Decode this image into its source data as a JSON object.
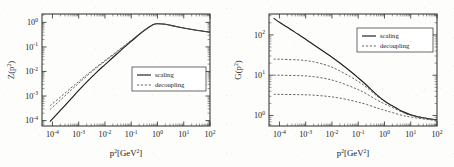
{
  "figure": {
    "background_color": "#fdfdfc",
    "ink_color": "#1c1c1c"
  },
  "chart_data": [
    {
      "type": "line",
      "panel": "left",
      "title": "",
      "xlabel": "p²[GeV²]",
      "ylabel": "Z(p²)",
      "xscale": "log",
      "yscale": "log",
      "xlim": [
        4e-05,
        100
      ],
      "ylim": [
        6e-05,
        2.2
      ],
      "xticks": [
        "10⁻⁴",
        "10⁻³",
        "10⁻²",
        "10⁻¹",
        "10⁰",
        "10¹",
        "10²"
      ],
      "xtick_values": [
        0.0001,
        0.001,
        0.01,
        0.1,
        1,
        10,
        100
      ],
      "yticks": [
        "10⁰",
        "10⁻¹",
        "10⁻²",
        "10⁻³",
        "10⁻⁴"
      ],
      "ytick_values": [
        1,
        0.1,
        0.01,
        0.001,
        0.0001
      ],
      "grid": false,
      "legend_position": "center-right",
      "legend": [
        "scaling",
        "decoupling"
      ],
      "series": [
        {
          "name": "scaling",
          "style": "solid",
          "x": [
            8e-05,
            0.0002,
            0.0005,
            0.001,
            0.002,
            0.005,
            0.01,
            0.02,
            0.05,
            0.1,
            0.2,
            0.4,
            0.7,
            1.0,
            2.0,
            5.0,
            10.0,
            30.0,
            100.0
          ],
          "y": [
            9e-05,
            0.00026,
            0.00075,
            0.0017,
            0.0037,
            0.0097,
            0.019,
            0.037,
            0.09,
            0.17,
            0.32,
            0.56,
            0.82,
            0.88,
            0.84,
            0.68,
            0.59,
            0.48,
            0.4
          ]
        },
        {
          "name": "decoupling-1",
          "style": "dashed",
          "x": [
            8e-05,
            0.0002,
            0.0005,
            0.001,
            0.002,
            0.005,
            0.01,
            0.02,
            0.05,
            0.1,
            0.2,
            0.4,
            0.7,
            1.0,
            2.0,
            5.0,
            10.0,
            30.0,
            100.0
          ],
          "y": [
            0.00028,
            0.00068,
            0.0017,
            0.0033,
            0.0064,
            0.0145,
            0.026,
            0.046,
            0.1,
            0.18,
            0.33,
            0.57,
            0.82,
            0.88,
            0.84,
            0.68,
            0.59,
            0.48,
            0.4
          ]
        },
        {
          "name": "decoupling-2",
          "style": "dashed",
          "x": [
            8e-05,
            0.0002,
            0.0005,
            0.001,
            0.002,
            0.005,
            0.01,
            0.02,
            0.05,
            0.1,
            0.2,
            0.4,
            0.7,
            1.0,
            2.0,
            5.0,
            10.0,
            30.0,
            100.0
          ],
          "y": [
            0.0004,
            0.0009,
            0.0021,
            0.0039,
            0.0073,
            0.016,
            0.028,
            0.049,
            0.105,
            0.185,
            0.335,
            0.575,
            0.825,
            0.882,
            0.841,
            0.681,
            0.591,
            0.481,
            0.401
          ]
        }
      ]
    },
    {
      "type": "line",
      "panel": "right",
      "title": "",
      "xlabel": "p²[GeV²]",
      "ylabel": "G(p²)",
      "xscale": "log",
      "yscale": "log",
      "xlim": [
        4e-05,
        100
      ],
      "ylim": [
        0.55,
        330
      ],
      "xticks": [
        "10⁻⁴",
        "10⁻³",
        "10⁻²",
        "10⁻¹",
        "10⁰",
        "10¹",
        "10²"
      ],
      "xtick_values": [
        0.0001,
        0.001,
        0.01,
        0.1,
        1,
        10,
        100
      ],
      "yticks": [
        "10²",
        "10¹",
        "10⁰"
      ],
      "ytick_values": [
        100,
        10,
        1
      ],
      "grid": false,
      "legend_position": "upper-right",
      "legend": [
        "scaling",
        "decoupling"
      ],
      "series": [
        {
          "name": "scaling",
          "style": "solid",
          "x": [
            6e-05,
            0.0001,
            0.0002,
            0.0005,
            0.001,
            0.002,
            0.005,
            0.01,
            0.02,
            0.05,
            0.1,
            0.2,
            0.5,
            1.0,
            2.0,
            5.0,
            10.0,
            30.0,
            100.0
          ],
          "y": [
            260,
            205,
            155,
            105,
            78,
            57,
            38,
            28,
            20,
            12.5,
            8.6,
            5.8,
            3.3,
            2.3,
            1.75,
            1.25,
            1.05,
            0.88,
            0.78
          ]
        },
        {
          "name": "decoupling-high",
          "style": "dashed",
          "x": [
            6e-05,
            0.0001,
            0.0002,
            0.0005,
            0.001,
            0.002,
            0.005,
            0.01,
            0.02,
            0.05,
            0.1,
            0.2,
            0.5,
            1.0,
            2.0,
            5.0,
            10.0,
            30.0,
            100.0
          ],
          "y": [
            25,
            25,
            24.5,
            24,
            23,
            21.5,
            18.5,
            15.8,
            12.8,
            9.2,
            7.0,
            5.1,
            3.1,
            2.25,
            1.72,
            1.24,
            1.04,
            0.88,
            0.78
          ]
        },
        {
          "name": "decoupling-mid",
          "style": "dashed",
          "x": [
            6e-05,
            0.0001,
            0.0002,
            0.0005,
            0.001,
            0.002,
            0.005,
            0.01,
            0.02,
            0.05,
            0.1,
            0.2,
            0.5,
            1.0,
            2.0,
            5.0,
            10.0,
            30.0,
            100.0
          ],
          "y": [
            10,
            10,
            9.9,
            9.8,
            9.6,
            9.2,
            8.4,
            7.6,
            6.6,
            5.3,
            4.4,
            3.5,
            2.45,
            1.95,
            1.58,
            1.19,
            1.01,
            0.86,
            0.77
          ]
        },
        {
          "name": "decoupling-low",
          "style": "dashed",
          "x": [
            6e-05,
            0.0001,
            0.0002,
            0.0005,
            0.001,
            0.002,
            0.005,
            0.01,
            0.02,
            0.05,
            0.1,
            0.2,
            0.5,
            1.0,
            2.0,
            5.0,
            10.0,
            30.0,
            100.0
          ],
          "y": [
            3.35,
            3.35,
            3.33,
            3.3,
            3.27,
            3.2,
            3.05,
            2.9,
            2.7,
            2.4,
            2.15,
            1.9,
            1.55,
            1.35,
            1.18,
            1.0,
            0.92,
            0.82,
            0.75
          ]
        }
      ]
    }
  ]
}
